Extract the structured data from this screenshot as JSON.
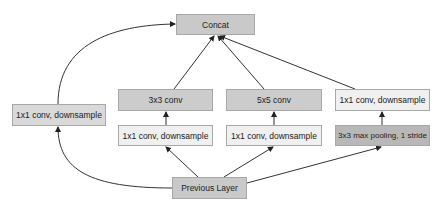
{
  "diagram": {
    "type": "flowchart",
    "nodes": [
      {
        "id": "concat",
        "label": "Concat",
        "x": 176,
        "y": 14,
        "w": 79,
        "h": 21,
        "fill": "#c9c9c9"
      },
      {
        "id": "left_1x1",
        "label": "1x1 conv, downsample",
        "x": 12,
        "y": 104,
        "w": 94,
        "h": 22,
        "fill": "#d9d9d9"
      },
      {
        "id": "conv3",
        "label": "3x3 conv",
        "x": 118,
        "y": 89,
        "w": 95,
        "h": 22,
        "fill": "#cccccc"
      },
      {
        "id": "red3",
        "label": "1x1 conv, downsample",
        "x": 118,
        "y": 125,
        "w": 95,
        "h": 21,
        "fill": "#f0f0f0"
      },
      {
        "id": "conv5",
        "label": "5x5 conv",
        "x": 226,
        "y": 89,
        "w": 96,
        "h": 22,
        "fill": "#cccccc"
      },
      {
        "id": "red5",
        "label": "1x1 conv, downsample",
        "x": 226,
        "y": 125,
        "w": 96,
        "h": 21,
        "fill": "#f0f0f0"
      },
      {
        "id": "pool_1x1",
        "label": "1x1 conv, downsample",
        "x": 335,
        "y": 89,
        "w": 95,
        "h": 22,
        "fill": "#f0f0f0"
      },
      {
        "id": "pool",
        "label": "3x3 max pooling, 1 stride",
        "x": 335,
        "y": 125,
        "w": 95,
        "h": 21,
        "fill": "#b8b8b8"
      },
      {
        "id": "prev",
        "label": "Previous Layer",
        "x": 172,
        "y": 177,
        "w": 75,
        "h": 22,
        "fill": "#c9c9c9"
      }
    ],
    "edges": [
      {
        "from": "prev",
        "to": "left_1x1"
      },
      {
        "from": "left_1x1",
        "to": "concat"
      },
      {
        "from": "prev",
        "to": "red3"
      },
      {
        "from": "prev",
        "to": "red5"
      },
      {
        "from": "prev",
        "to": "pool"
      },
      {
        "from": "red3",
        "to": "conv3"
      },
      {
        "from": "red5",
        "to": "conv5"
      },
      {
        "from": "pool",
        "to": "pool_1x1"
      },
      {
        "from": "conv3",
        "to": "concat"
      },
      {
        "from": "conv5",
        "to": "concat"
      },
      {
        "from": "pool_1x1",
        "to": "concat"
      }
    ]
  }
}
